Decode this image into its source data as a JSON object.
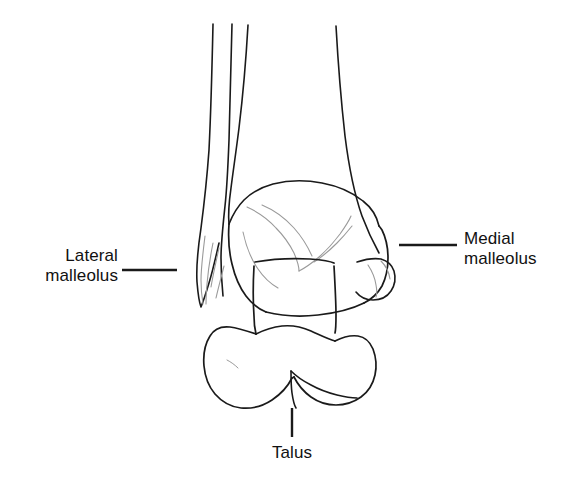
{
  "figure": {
    "type": "anatomical-line-drawing",
    "background_color": "#ffffff",
    "outline_color": "#1a1a1a",
    "detail_color": "#8a8a8a",
    "leader_color": "#1a1a1a"
  },
  "labels": {
    "lateral_malleolus": {
      "line1": "Lateral",
      "line2": "malleolus",
      "text_color": "#111111",
      "leader": {
        "x1": 122,
        "y1": 270,
        "x2": 177,
        "y2": 270
      }
    },
    "medial_malleolus": {
      "line1": "Medial",
      "line2": "malleolus",
      "text_color": "#111111",
      "leader": {
        "x1": 399,
        "y1": 245,
        "x2": 457,
        "y2": 245
      }
    },
    "talus": {
      "line1": "Talus",
      "text_color": "#111111",
      "leader": {
        "x1": 292,
        "y1": 408,
        "x2": 292,
        "y2": 437
      }
    }
  }
}
